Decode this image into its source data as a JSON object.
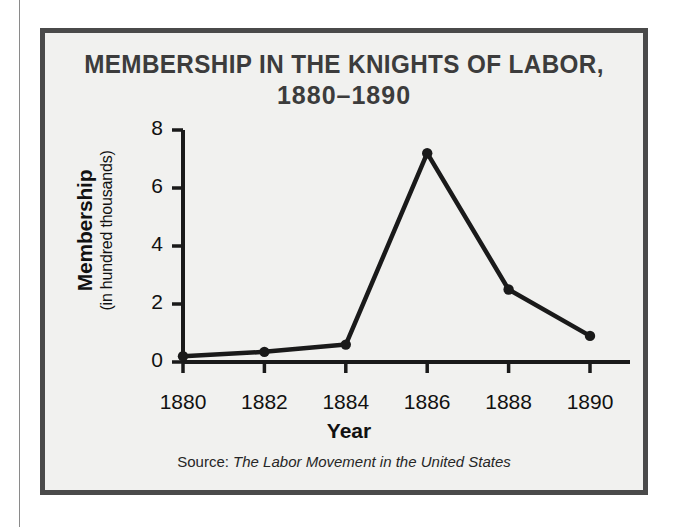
{
  "figure": {
    "title_line1": "MEMBERSHIP IN THE KNIGHTS OF LABOR,",
    "title_line2": "1880–1890",
    "source_label": "Source:",
    "source_title": "The Labor Movement in the United States",
    "border_color": "#4a4a4a",
    "background_color": "#f1f1ef",
    "title_color": "#3c3c3c",
    "series_color": "#1a1a1a"
  },
  "chart_data": {
    "type": "line",
    "title": "MEMBERSHIP IN THE KNIGHTS OF LABOR, 1880–1890",
    "xlabel": "Year",
    "ylabel": "Membership (in hundred thousands)",
    "ylabel_main": "Membership",
    "ylabel_sub": "(in hundred thousands)",
    "x": [
      1880,
      1882,
      1884,
      1886,
      1888,
      1890
    ],
    "categories": [
      "1880",
      "1882",
      "1884",
      "1886",
      "1888",
      "1890"
    ],
    "values": [
      0.2,
      0.35,
      0.6,
      7.2,
      2.5,
      0.9
    ],
    "series": [
      {
        "name": "Membership",
        "values": [
          0.2,
          0.35,
          0.6,
          7.2,
          2.5,
          0.9
        ]
      }
    ],
    "xlim": [
      1880,
      1890
    ],
    "ylim": [
      0,
      8
    ],
    "yticks": [
      0,
      2,
      4,
      6,
      8
    ],
    "ytick_labels": [
      "0",
      "2",
      "4",
      "6",
      "8"
    ],
    "xticks": [
      1880,
      1882,
      1884,
      1886,
      1888,
      1890
    ],
    "xtick_labels": [
      "1880",
      "1882",
      "1884",
      "1886",
      "1888",
      "1890"
    ],
    "grid": false,
    "legend": false,
    "marker": "circle",
    "units": "hundred thousands",
    "source": "The Labor Movement in the United States"
  }
}
